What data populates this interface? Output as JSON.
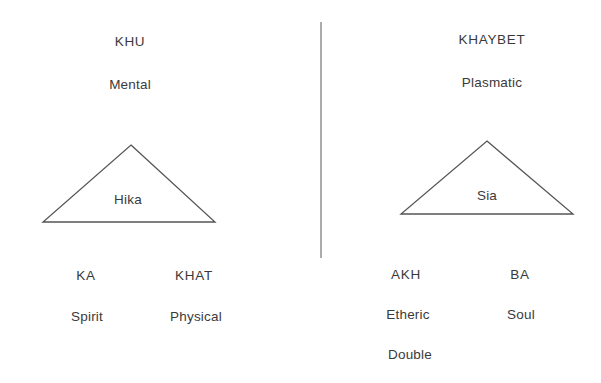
{
  "canvas": {
    "width": 601,
    "height": 383,
    "background": "#ffffff",
    "ink": "#3a3a3a",
    "stroke": "#555555"
  },
  "divider": {
    "name": "vertical-divider",
    "x": 321,
    "y_top": 22,
    "y_bottom": 258,
    "color": "#888888"
  },
  "panels": [
    {
      "id": "left",
      "title": "KHU",
      "subtitle": "Mental",
      "triangle": {
        "apex_x": 131,
        "apex_y": 145,
        "left_x": 43,
        "right_x": 215,
        "base_y": 222
      },
      "triangle_label": "Hika",
      "columns": [
        {
          "name": "KA",
          "description": "Spirit",
          "extra": ""
        },
        {
          "name": "KHAT",
          "description": "Physical",
          "extra": ""
        }
      ]
    },
    {
      "id": "right",
      "title": "KHAYBET",
      "subtitle": "Plasmatic",
      "triangle": {
        "apex_x": 487,
        "apex_y": 141,
        "left_x": 401,
        "right_x": 573,
        "base_y": 214
      },
      "triangle_label": "Sia",
      "columns": [
        {
          "name": "AKH",
          "description": "Etheric",
          "extra": "Double"
        },
        {
          "name": "BA",
          "description": "Soul",
          "extra": ""
        }
      ]
    }
  ],
  "positions": {
    "left_title": {
      "x": 130,
      "y": 42
    },
    "left_subtitle": {
      "x": 130,
      "y": 85
    },
    "left_tri_label": {
      "x": 128,
      "y": 200
    },
    "left_col1_name": {
      "x": 86,
      "y": 276
    },
    "left_col1_desc": {
      "x": 87,
      "y": 317
    },
    "left_col2_name": {
      "x": 194,
      "y": 276
    },
    "left_col2_desc": {
      "x": 196,
      "y": 317
    },
    "right_title": {
      "x": 492,
      "y": 40
    },
    "right_subtitle": {
      "x": 492,
      "y": 83
    },
    "right_tri_label": {
      "x": 487,
      "y": 196
    },
    "right_col1_name": {
      "x": 406,
      "y": 275
    },
    "right_col1_desc": {
      "x": 408,
      "y": 315
    },
    "right_col1_extra": {
      "x": 410,
      "y": 355
    },
    "right_col2_name": {
      "x": 520,
      "y": 275
    },
    "right_col2_desc": {
      "x": 521,
      "y": 315
    }
  }
}
